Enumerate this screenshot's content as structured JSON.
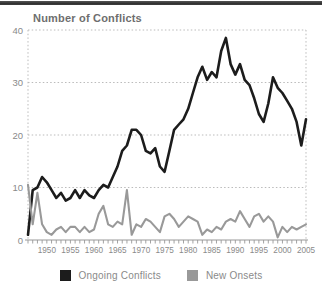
{
  "chart_data": {
    "type": "line",
    "title": "Number of Conflicts",
    "xlabel": "",
    "ylabel": "Number of Conflicts",
    "xlim": [
      1946,
      2005
    ],
    "ylim": [
      0,
      40
    ],
    "yticks": [
      0,
      10,
      20,
      30,
      40
    ],
    "xtick_labels": [
      "1950",
      "1955",
      "1960",
      "1965",
      "1970",
      "1975",
      "1980",
      "1985",
      "1990",
      "1995",
      "2000",
      "2005"
    ],
    "grid": "horizontal-dotted",
    "legend_position": "bottom",
    "x": [
      1946,
      1947,
      1948,
      1949,
      1950,
      1951,
      1952,
      1953,
      1954,
      1955,
      1956,
      1957,
      1958,
      1959,
      1960,
      1961,
      1962,
      1963,
      1964,
      1965,
      1966,
      1967,
      1968,
      1969,
      1970,
      1971,
      1972,
      1973,
      1974,
      1975,
      1976,
      1977,
      1978,
      1979,
      1980,
      1981,
      1982,
      1983,
      1984,
      1985,
      1986,
      1987,
      1988,
      1989,
      1990,
      1991,
      1992,
      1993,
      1994,
      1995,
      1996,
      1997,
      1998,
      1999,
      2000,
      2001,
      2002,
      2003,
      2004,
      2005
    ],
    "series": [
      {
        "name": "Ongoing Conflicts",
        "color": "#1c1c1c",
        "values": [
          1,
          9.5,
          10,
          12,
          11,
          9.5,
          8,
          9,
          7.5,
          8,
          9.5,
          8,
          9.5,
          8.5,
          8,
          9.5,
          10.5,
          10,
          12,
          14,
          17,
          18,
          21,
          21,
          20,
          17,
          16.5,
          17.5,
          14,
          13,
          17,
          21,
          22,
          23,
          25,
          28,
          31,
          33,
          30.5,
          32,
          31,
          36,
          38.5,
          33.5,
          31.5,
          33.5,
          30.5,
          29.5,
          27,
          24,
          22.5,
          26,
          31,
          29,
          28,
          26.5,
          25,
          22.5,
          18,
          23
        ]
      },
      {
        "name": "New Onsets",
        "color": "#999999",
        "values": [
          10.5,
          3,
          9,
          3,
          1.5,
          1,
          2,
          2.5,
          1.5,
          2.5,
          2.5,
          1.5,
          2.5,
          1.5,
          2,
          5,
          6.5,
          3,
          2.5,
          3.5,
          3,
          9.5,
          1,
          3,
          2.5,
          4,
          3.5,
          2.5,
          1.5,
          4.5,
          5,
          4,
          2.5,
          3.5,
          4.5,
          4,
          3.5,
          1,
          2,
          1.5,
          2.5,
          2,
          3.5,
          4,
          3.5,
          5.5,
          4,
          2.5,
          4.5,
          5,
          3.5,
          4.5,
          3.5,
          0.5,
          2.5,
          1.5,
          2.5,
          2,
          2.5,
          3
        ]
      }
    ]
  },
  "legend": {
    "items": [
      {
        "label": "Ongoing Conflicts",
        "color": "#1c1c1c"
      },
      {
        "label": "New Onsets",
        "color": "#999999"
      }
    ]
  },
  "style_colors": {
    "axis_text": "#8a8a8a",
    "grid": "#bbbbbb",
    "axis_line": "#999999",
    "title_text": "#6e6e6e",
    "top_bar": "#2e2e2e"
  }
}
